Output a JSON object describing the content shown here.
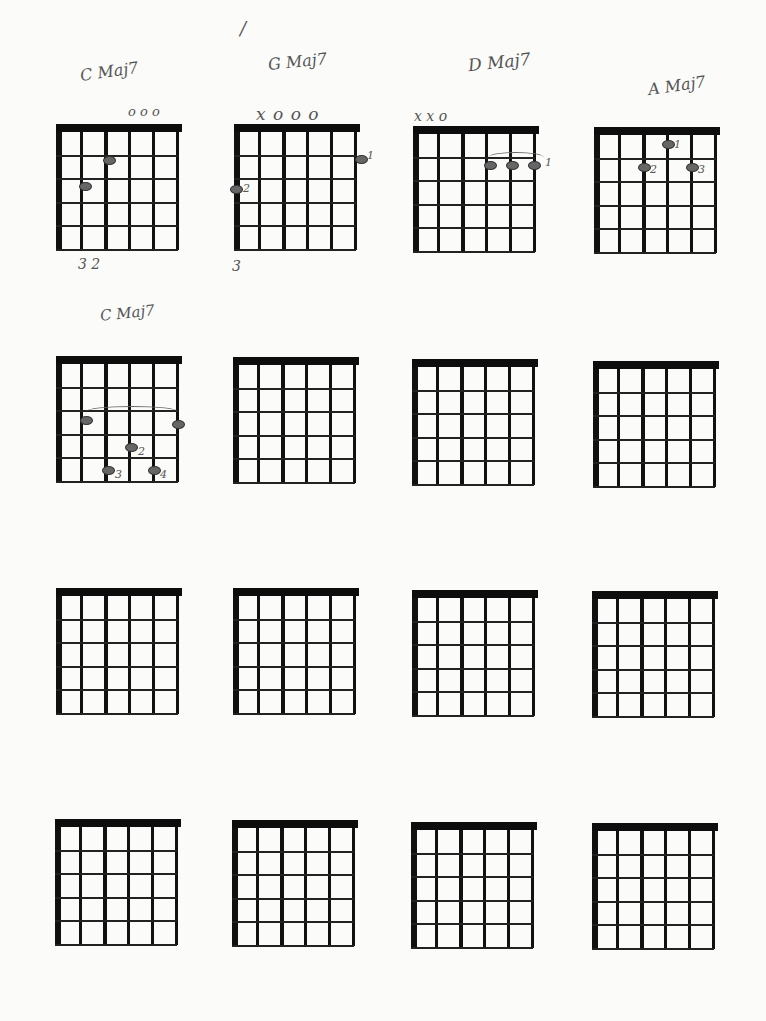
{
  "page": {
    "stray_mark": "/"
  },
  "diagrams": [
    {
      "label": "C Maj7",
      "open_marks": "o o o",
      "fret_label": "3 2",
      "fingers": []
    },
    {
      "label": "G Maj7",
      "open_marks": "x o o o",
      "fret_label": "3",
      "fingers": [
        "1",
        "2"
      ]
    },
    {
      "label": "D Maj7",
      "open_marks": "x x o",
      "fret_label": "",
      "fingers": [
        "1"
      ]
    },
    {
      "label": "A Maj7",
      "open_marks": "",
      "fret_label": "",
      "fingers": [
        "1",
        "2",
        "3"
      ]
    },
    {
      "label": "C Maj7",
      "open_marks": "",
      "fret_label": "",
      "fingers": [
        "2",
        "3",
        "4"
      ]
    },
    {
      "label": "",
      "open_marks": "",
      "fret_label": "",
      "fingers": []
    },
    {
      "label": "",
      "open_marks": "",
      "fret_label": "",
      "fingers": []
    },
    {
      "label": "",
      "open_marks": "",
      "fret_label": "",
      "fingers": []
    },
    {
      "label": "",
      "open_marks": "",
      "fret_label": "",
      "fingers": []
    },
    {
      "label": "",
      "open_marks": "",
      "fret_label": "",
      "fingers": []
    },
    {
      "label": "",
      "open_marks": "",
      "fret_label": "",
      "fingers": []
    },
    {
      "label": "",
      "open_marks": "",
      "fret_label": "",
      "fingers": []
    },
    {
      "label": "",
      "open_marks": "",
      "fret_label": "",
      "fingers": []
    },
    {
      "label": "",
      "open_marks": "",
      "fret_label": "",
      "fingers": []
    },
    {
      "label": "",
      "open_marks": "",
      "fret_label": "",
      "fingers": []
    },
    {
      "label": "",
      "open_marks": "",
      "fret_label": "",
      "fingers": []
    }
  ],
  "grid": {
    "rows": 4,
    "cols": 4,
    "strings": 6,
    "frets": 5
  }
}
